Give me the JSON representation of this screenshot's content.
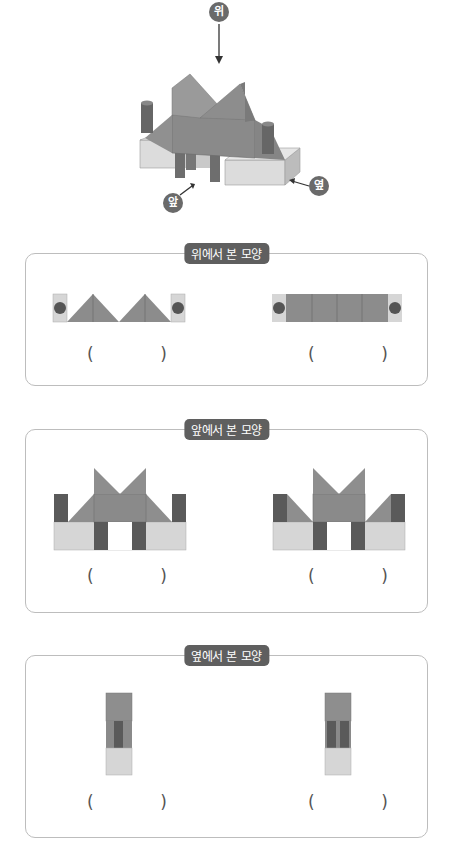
{
  "figure": {
    "direction_labels": {
      "top": "위",
      "front": "앞",
      "side": "옆"
    }
  },
  "panels": [
    {
      "label": "위에서 본 모양",
      "choices": [
        {
          "open": "(",
          "close": ")"
        },
        {
          "open": "(",
          "close": ")"
        }
      ]
    },
    {
      "label": "앞에서 본 모양",
      "choices": [
        {
          "open": "(",
          "close": ")"
        },
        {
          "open": "(",
          "close": ")"
        }
      ]
    },
    {
      "label": "옆에서 본 모양",
      "choices": [
        {
          "open": "(",
          "close": ")"
        },
        {
          "open": "(",
          "close": ")"
        }
      ]
    }
  ],
  "colors": {
    "light_block": "#d4d4d4",
    "mid_block": "#8e8e8e",
    "dark_cylinder": "#5a5a5a",
    "label_bg": "#5f5f5f",
    "border": "#bdbdbd"
  }
}
